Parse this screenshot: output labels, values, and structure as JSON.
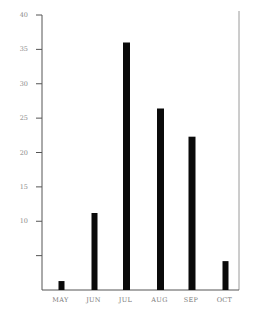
{
  "chart_data": {
    "type": "bar",
    "title": "",
    "xlabel": "",
    "ylabel": "",
    "categories": [
      "MAY",
      "JUN",
      "JUL",
      "AUG",
      "SEP",
      "OCT"
    ],
    "values": [
      1.3,
      11.2,
      36,
      26.4,
      22.3,
      4.2
    ],
    "ylim": [
      0,
      40
    ],
    "yticks": [
      5,
      10,
      15,
      20,
      25,
      30,
      35,
      40
    ],
    "ytick_labels": [
      "",
      "10",
      "15",
      "20",
      "25",
      "30",
      "35",
      "40"
    ],
    "grid": false,
    "legend": null,
    "bar_color": "#0a0a0a",
    "axis_color": "#555555",
    "frame_right_color": "#9a9a9a"
  }
}
